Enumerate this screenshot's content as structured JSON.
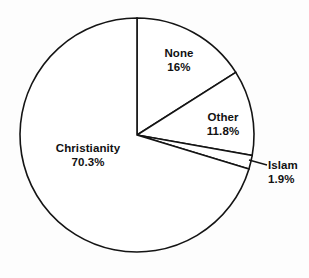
{
  "chart_data": {
    "type": "pie",
    "title": "",
    "subtitle": "",
    "xlabel": "",
    "ylabel": "",
    "legend_position": "none",
    "grid": false,
    "start_angle_deg": 0,
    "direction": "clockwise",
    "units": "percent",
    "total": 100,
    "categories": [
      "None",
      "Other",
      "Islam",
      "Christianity"
    ],
    "values": [
      16,
      11.8,
      1.9,
      70.3
    ],
    "value_labels": [
      "16%",
      "11.8%",
      "1.9%",
      "70.3%"
    ],
    "slices": [
      {
        "name": "None",
        "value": 16,
        "value_label": "16%",
        "fill": "#ffffff",
        "stroke": "#141414",
        "label_x": 179,
        "label_y": 47,
        "label_align": "centered",
        "has_leader": false
      },
      {
        "name": "Other",
        "value": 11.8,
        "value_label": "11.8%",
        "fill": "#ffffff",
        "stroke": "#141414",
        "label_x": 223,
        "label_y": 111,
        "label_align": "centered",
        "has_leader": false
      },
      {
        "name": "Islam",
        "value": 1.9,
        "value_label": "1.9%",
        "fill": "#ffffff",
        "stroke": "#141414",
        "label_x": 268,
        "label_y": 159,
        "label_align": "left",
        "has_leader": true,
        "leader": {
          "x1": 249,
          "y1": 160,
          "x2": 267,
          "y2": 165
        }
      },
      {
        "name": "Christianity",
        "value": 70.3,
        "value_label": "70.3%",
        "fill": "#ffffff",
        "stroke": "#141414",
        "label_x": 88,
        "label_y": 142,
        "label_align": "centered",
        "has_leader": false
      }
    ],
    "geometry": {
      "center_x": 137,
      "center_y": 135,
      "radius": 117
    }
  }
}
